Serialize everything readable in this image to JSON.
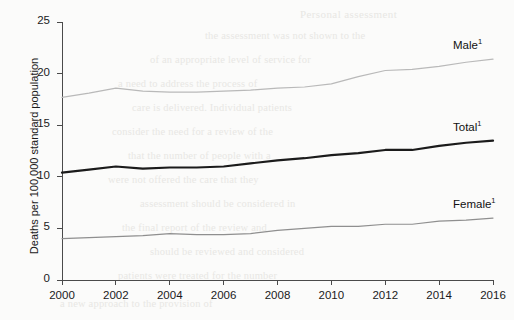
{
  "chart_data": {
    "type": "line",
    "title": "",
    "xlabel": "",
    "ylabel": "Deaths per 100,000 standard population",
    "xlim": [
      2000,
      2016
    ],
    "ylim": [
      0,
      25
    ],
    "grid": false,
    "legend_position": "right-inline",
    "x": [
      2000,
      2001,
      2002,
      2003,
      2004,
      2005,
      2006,
      2007,
      2008,
      2009,
      2010,
      2011,
      2012,
      2013,
      2014,
      2015,
      2016
    ],
    "xticks": [
      "2000",
      "2002",
      "2004",
      "2006",
      "2008",
      "2010",
      "2012",
      "2014",
      "2016"
    ],
    "yticks": [
      "0",
      "5",
      "10",
      "15",
      "20",
      "25"
    ],
    "series": [
      {
        "name": "Male",
        "label": "Male",
        "footnote_marker": "1",
        "color": "#b9b9b9",
        "width": 1.2,
        "values": [
          17.7,
          18.1,
          18.6,
          18.3,
          18.2,
          18.2,
          18.3,
          18.4,
          18.6,
          18.7,
          19.0,
          19.7,
          20.3,
          20.4,
          20.7,
          21.1,
          21.4
        ]
      },
      {
        "name": "Total",
        "label": "Total",
        "footnote_marker": "1",
        "color": "#1b1b1b",
        "width": 2.2,
        "values": [
          10.4,
          10.7,
          11.0,
          10.8,
          10.9,
          10.9,
          11.0,
          11.3,
          11.6,
          11.8,
          12.1,
          12.3,
          12.6,
          12.6,
          13.0,
          13.3,
          13.5
        ]
      },
      {
        "name": "Female",
        "label": "Female",
        "footnote_marker": "1",
        "color": "#8f8f8f",
        "width": 1.2,
        "values": [
          4.0,
          4.1,
          4.2,
          4.3,
          4.5,
          4.4,
          4.4,
          4.5,
          4.8,
          5.0,
          5.2,
          5.2,
          5.4,
          5.4,
          5.7,
          5.8,
          6.0
        ]
      }
    ]
  },
  "axis": {
    "y_title": "Deaths per 100,000 standard population"
  },
  "background_bleed": {
    "title": "Personal assessment",
    "lines": [
      "the assessment was not shown to the",
      "of an appropriate level of service for",
      "a need to address the process of",
      "care is delivered. Individual patients",
      "consider the need for a review of the",
      "that the number of people with a",
      "were not offered the care that they",
      "assessment should be considered in",
      "the final report of the review and",
      "should be reviewed and considered",
      "patients were treated for the number",
      "a new approach to the provision of",
      "the level of care received by the",
      "report of the care received by people"
    ]
  }
}
